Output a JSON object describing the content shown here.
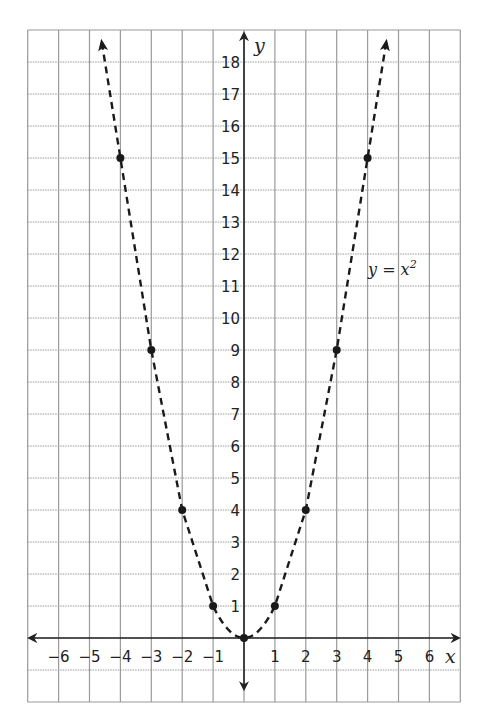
{
  "chart_data": {
    "type": "line",
    "title": "",
    "xlabel": "x",
    "ylabel": "y",
    "equation_label": "y = x²",
    "equation_text": "y = x",
    "equation_exponent": "2",
    "xlim": [
      -7,
      7
    ],
    "ylim": [
      -2,
      19
    ],
    "grid": true,
    "x_ticks": [
      -6,
      -5,
      -4,
      -3,
      -2,
      -1,
      1,
      2,
      3,
      4,
      5,
      6
    ],
    "y_ticks": [
      1,
      2,
      3,
      4,
      5,
      6,
      7,
      8,
      9,
      10,
      11,
      12,
      13,
      14,
      15,
      16,
      17,
      18
    ],
    "series": [
      {
        "name": "y = x²",
        "style": "dashed",
        "arrows": true,
        "points": [
          {
            "x": -4,
            "y": 15
          },
          {
            "x": -3,
            "y": 9
          },
          {
            "x": -2,
            "y": 4
          },
          {
            "x": -1,
            "y": 1
          },
          {
            "x": 0,
            "y": 0
          },
          {
            "x": 1,
            "y": 1
          },
          {
            "x": 2,
            "y": 4
          },
          {
            "x": 3,
            "y": 9
          },
          {
            "x": 4,
            "y": 15
          }
        ]
      }
    ]
  },
  "colors": {
    "grid": "#9a9a9a",
    "axis": "#222222",
    "curve": "#1a1a1a"
  }
}
